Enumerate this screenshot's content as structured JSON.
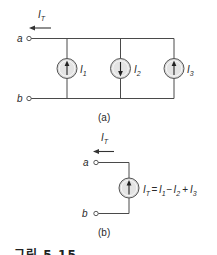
{
  "figure_a": {
    "current_label": "I",
    "current_sub": "T",
    "terminal_a": "a",
    "terminal_b": "b",
    "sources": [
      {
        "label": "I",
        "sub": "1",
        "direction": "up"
      },
      {
        "label": "I",
        "sub": "2",
        "direction": "down"
      },
      {
        "label": "I",
        "sub": "3",
        "direction": "up"
      }
    ],
    "caption": "(a)"
  },
  "figure_b": {
    "current_label": "I",
    "current_sub": "T",
    "terminal_a": "a",
    "terminal_b": "b",
    "source_direction": "up",
    "equation": {
      "lhs": "I",
      "lhs_sub": "T",
      "eq": "=",
      "t1": "I",
      "t1_sub": "1",
      "op1": "−",
      "t2": "I",
      "t2_sub": "2",
      "op2": "+",
      "t3": "I",
      "t3_sub": "3"
    },
    "caption": "(b)"
  },
  "figure_caption_partial": "그림 5.15",
  "colors": {
    "wire": "#4a4a4a",
    "source_fill": "#d9d9d9",
    "text": "#2a2a2a"
  }
}
